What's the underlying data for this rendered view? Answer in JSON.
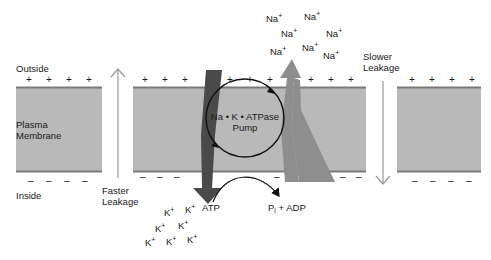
{
  "labels": {
    "outside": "Outside",
    "inside": "Inside",
    "membrane_line1": "Plasma",
    "membrane_line2": "Membrane",
    "faster_line1": "Faster",
    "faster_line2": "Leakage",
    "slower_line1": "Slower",
    "slower_line2": "Leakage",
    "pump_line1": "Na • K • ATPase",
    "pump_line2": "Pump",
    "atp": "ATP",
    "products": "P",
    "products_sub": "i",
    "products_rest": " + ADP"
  },
  "ions": {
    "sodium": {
      "symbol": "Na",
      "charge": "+",
      "count": 7
    },
    "potassium": {
      "symbol": "K",
      "charge": "+",
      "count": 7
    }
  },
  "signs": {
    "positive": "+",
    "negative": "–"
  },
  "colors": {
    "membrane_fill": "#b9b9b9",
    "membrane_edge": "#7a7a7a",
    "k_arrow": "#4a4a4a",
    "na_arrow": "#8e8e8e",
    "leak_arrow": "#9a9a9a"
  }
}
